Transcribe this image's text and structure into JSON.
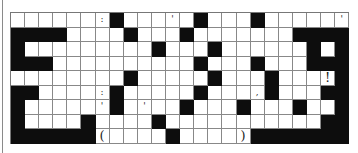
{
  "puzzle": {
    "columns": 24,
    "rows": 9,
    "grid": [
      [
        ".",
        ".",
        ".",
        ".",
        ".",
        ".",
        ":",
        "#",
        ".",
        ".",
        ".",
        "'",
        ".",
        "#",
        ".",
        ".",
        ".",
        "#",
        ".",
        ".",
        ".",
        ".",
        ".",
        "'"
      ],
      [
        "#",
        "#",
        "#",
        "#",
        ".",
        ".",
        ".",
        ".",
        "#",
        ".",
        ".",
        ".",
        "#",
        ".",
        ".",
        ".",
        ".",
        ".",
        ".",
        ".",
        "#",
        "#",
        "#",
        "#"
      ],
      [
        "#",
        ".",
        ".",
        ".",
        ".",
        ".",
        ".",
        ".",
        ".",
        ".",
        "#",
        ".",
        ".",
        ".",
        "#",
        ".",
        ".",
        ".",
        ".",
        ".",
        ".",
        "#",
        ".",
        "#"
      ],
      [
        "#",
        "#",
        "#",
        ".",
        ".",
        ".",
        ".",
        ".",
        ".",
        ".",
        ".",
        ".",
        ".",
        "#",
        ".",
        ".",
        ".",
        "#",
        ".",
        ".",
        ".",
        "#",
        "#",
        "#"
      ],
      [
        ".",
        ".",
        ".",
        ".",
        ".",
        ".",
        ".",
        ".",
        "#",
        ".",
        ".",
        ".",
        ".",
        ".",
        "#",
        ".",
        ".",
        ".",
        "#",
        ".",
        ".",
        ".",
        "!",
        "#"
      ],
      [
        "#",
        "#",
        ".",
        ".",
        ".",
        ".",
        ":",
        "#",
        ".",
        ".",
        ".",
        ".",
        ".",
        "#",
        ".",
        ".",
        ".",
        ",",
        "#",
        ".",
        ".",
        ".",
        "#",
        "#"
      ],
      [
        "#",
        ".",
        ".",
        ".",
        ".",
        ".",
        "'",
        "#",
        ".",
        "'",
        ".",
        ".",
        "#",
        ".",
        ".",
        ".",
        "#",
        ".",
        ".",
        ".",
        "#",
        ".",
        ".",
        "#"
      ],
      [
        "#",
        ".",
        ".",
        ".",
        ".",
        "#",
        ".",
        ".",
        ".",
        ".",
        "#",
        ".",
        ".",
        ".",
        ".",
        ".",
        ".",
        ".",
        ".",
        ".",
        ".",
        ".",
        "#",
        "#"
      ],
      [
        "#",
        "#",
        "#",
        "#",
        "#",
        "#",
        "(",
        ".",
        ".",
        ".",
        ".",
        "#",
        ".",
        ".",
        ".",
        ".",
        ")",
        "#",
        "#",
        "#",
        "#",
        "#",
        "#",
        "#"
      ]
    ],
    "punctuation_marks": [
      {
        "row": 0,
        "col": 6,
        "char": ":"
      },
      {
        "row": 0,
        "col": 11,
        "char": "'"
      },
      {
        "row": 0,
        "col": 23,
        "char": "'"
      },
      {
        "row": 1,
        "col": 7,
        "char": "."
      },
      {
        "row": 2,
        "col": 20,
        "char": "."
      },
      {
        "row": 4,
        "col": 22,
        "char": "!"
      },
      {
        "row": 5,
        "col": 6,
        "char": ":"
      },
      {
        "row": 5,
        "col": 17,
        "char": ","
      },
      {
        "row": 5,
        "col": 21,
        "char": "."
      },
      {
        "row": 6,
        "col": 6,
        "char": "'"
      },
      {
        "row": 6,
        "col": 9,
        "char": "'"
      },
      {
        "row": 7,
        "col": 21,
        "char": "."
      },
      {
        "row": 8,
        "col": 6,
        "char": "("
      },
      {
        "row": 8,
        "col": 16,
        "char": ")"
      }
    ],
    "colors": {
      "block": "#0d0d0d",
      "cell": "#ffffff",
      "grid_line": "#888888"
    }
  }
}
